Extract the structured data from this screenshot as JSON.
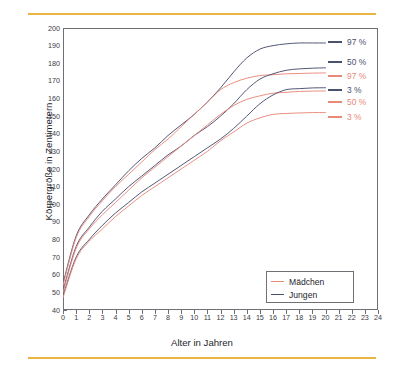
{
  "figure": {
    "colors": {
      "girls": "#e8897a",
      "boys": "#4a5070",
      "rule": "#e8b545",
      "frame": "#6f6f76",
      "text": "#26262c"
    }
  },
  "chart_data": {
    "type": "line",
    "title": "",
    "xlabel": "Alter in Jahren",
    "ylabel": "Körpergröße in Zentimetern",
    "xlim": [
      0,
      24
    ],
    "ylim": [
      40,
      200
    ],
    "grid": false,
    "legend_position": "bottom-right",
    "xticks": [
      "0",
      "1",
      "2",
      "3",
      "4",
      "5",
      "6",
      "7",
      "8",
      "9",
      "10",
      "11",
      "12",
      "13",
      "14",
      "15",
      "16",
      "17",
      "18",
      "19",
      "20",
      "21",
      "22",
      "23",
      "24"
    ],
    "yticks": [
      "40",
      "50",
      "60",
      "70",
      "80",
      "90",
      "100",
      "110",
      "120",
      "130",
      "140",
      "150",
      "160",
      "170",
      "180",
      "190",
      "200"
    ],
    "x": [
      0,
      1,
      2,
      3,
      4,
      5,
      6,
      7,
      8,
      9,
      10,
      11,
      12,
      13,
      14,
      15,
      16,
      17,
      18,
      19,
      20
    ],
    "series": [
      {
        "name": "Jungen 97 %",
        "group": "Jungen",
        "percentile": "97 %",
        "color": "#4a5070",
        "values": [
          55,
          82,
          94,
          103,
          111,
          119,
          126,
          132,
          139,
          145,
          151,
          158,
          166,
          175,
          183,
          188,
          190,
          191,
          191.5,
          191.5,
          191.5
        ]
      },
      {
        "name": "Mädchen 97 %",
        "group": "Mädchen",
        "percentile": "97 %",
        "color": "#e8897a",
        "values": [
          54,
          81,
          93,
          102,
          110,
          117,
          124,
          131,
          137,
          144,
          151,
          158,
          165,
          169,
          171.5,
          173,
          173.5,
          174,
          174.2,
          174.4,
          174.5
        ]
      },
      {
        "name": "Jungen 50 %",
        "group": "Jungen",
        "percentile": "50 %",
        "color": "#4a5070",
        "values": [
          51,
          76,
          87,
          96,
          103,
          110,
          116,
          122,
          128,
          133,
          139,
          144,
          150,
          157,
          165,
          171,
          174,
          176,
          176.8,
          177.2,
          177.4
        ]
      },
      {
        "name": "Mädchen 50 %",
        "group": "Mädchen",
        "percentile": "50 %",
        "color": "#e8897a",
        "values": [
          50,
          75,
          86,
          94,
          101,
          108,
          115,
          121,
          127,
          133,
          139,
          145,
          151,
          156,
          159.5,
          161.5,
          163,
          163.5,
          164,
          164.2,
          164.3
        ]
      },
      {
        "name": "Jungen 3 %",
        "group": "Jungen",
        "percentile": "3 %",
        "color": "#4a5070",
        "values": [
          48,
          70,
          80,
          88,
          95,
          101,
          107,
          112,
          117,
          122,
          127,
          132,
          137,
          143,
          150,
          157,
          162,
          165,
          165.6,
          166,
          166.1
        ]
      },
      {
        "name": "Mädchen 3 %",
        "group": "Mädchen",
        "percentile": "3 %",
        "color": "#e8897a",
        "values": [
          47,
          69,
          79,
          86,
          93,
          99,
          105,
          110,
          115,
          120,
          125,
          130,
          136,
          141,
          146,
          149,
          151,
          151.5,
          151.8,
          152,
          152
        ]
      }
    ],
    "annotations": [
      {
        "text": "97 %",
        "color": "#4a5070",
        "y_px": 42
      },
      {
        "text": "50 %",
        "color": "#4a5070",
        "y_px": 62
      },
      {
        "text": "97 %",
        "color": "#e8897a",
        "y_px": 76
      },
      {
        "text": "3 %",
        "color": "#4a5070",
        "y_px": 90
      },
      {
        "text": "50 %",
        "color": "#e8897a",
        "y_px": 102
      },
      {
        "text": "3 %",
        "color": "#e8897a",
        "y_px": 117
      }
    ],
    "legend": [
      {
        "label": "Mädchen",
        "color": "#e8897a"
      },
      {
        "label": "Jungen",
        "color": "#4a5070"
      }
    ]
  }
}
